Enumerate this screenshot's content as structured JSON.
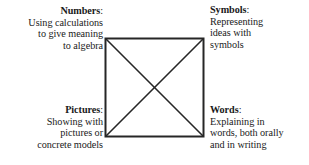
{
  "diagram": {
    "shape": {
      "name": "square-with-diagonals",
      "stroke_color": "#262626",
      "stroke_width": 2,
      "fill_color": "#ffffff",
      "x": 105,
      "y": 38,
      "width": 99,
      "height": 99
    },
    "background_color": "#ffffff",
    "text_color": "#1a1a1a",
    "quadrants": [
      {
        "id": "numbers",
        "position": "top-left",
        "align": "right",
        "term": "Numbers",
        "separator": ":",
        "description_lines": [
          "Using calculations",
          "to give meaning",
          "to algebra"
        ]
      },
      {
        "id": "symbols",
        "position": "top-right",
        "align": "left",
        "term": "Symbols",
        "separator": ":",
        "description_lines": [
          "Representing",
          "ideas with",
          "symbols"
        ]
      },
      {
        "id": "pictures",
        "position": "bottom-left",
        "align": "right",
        "term": "Pictures",
        "separator": ":",
        "description_lines": [
          "Showing with",
          "pictures or",
          "concrete models"
        ]
      },
      {
        "id": "words",
        "position": "bottom-right",
        "align": "left",
        "term": "Words",
        "separator": ":",
        "description_lines": [
          "Explaining in",
          "words, both orally",
          "and in writing"
        ]
      }
    ]
  }
}
